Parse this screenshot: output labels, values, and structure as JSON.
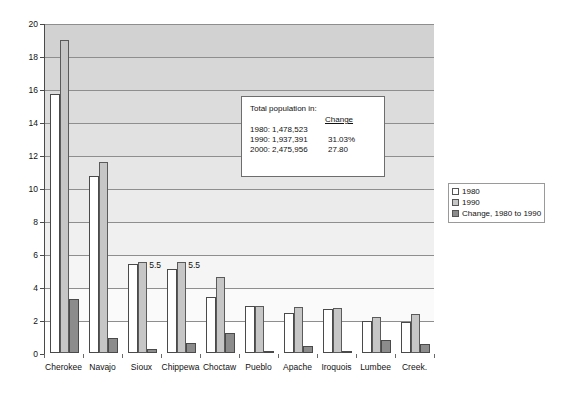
{
  "title_faint": "",
  "chart_data": {
    "type": "bar",
    "title": "",
    "subtitle": "",
    "xlabel": "",
    "ylabel": "",
    "ylim": [
      0,
      20
    ],
    "ytick_step": 2,
    "yticks": [
      "0",
      "2",
      "4",
      "6",
      "8",
      "10",
      "12",
      "14",
      "16",
      "18",
      "20"
    ],
    "grid": true,
    "legend_position": "right",
    "categories": [
      "Cherokee",
      "Navajo",
      "Sioux",
      "Chippewa",
      "Choctaw",
      "Pueblo",
      "Apache",
      "Iroquois",
      "Lumbee",
      "Creek."
    ],
    "series": [
      {
        "name": "1980",
        "color": "#ffffff",
        "values": [
          15.7,
          10.7,
          5.4,
          5.1,
          3.4,
          2.85,
          2.4,
          2.65,
          1.95,
          1.9
        ]
      },
      {
        "name": "1990",
        "color": "#c6c6c6",
        "values": [
          19.0,
          11.6,
          5.5,
          5.5,
          4.6,
          2.85,
          2.8,
          2.75,
          2.2,
          2.35
        ]
      },
      {
        "name": "Change, 1980 to 1990",
        "color": "#8c8c8c",
        "values": [
          3.3,
          0.9,
          0.25,
          0.6,
          1.2,
          0.0,
          0.45,
          0.15,
          0.8,
          0.55
        ]
      }
    ],
    "annotations": [
      {
        "text": "5.5",
        "category": "Sioux",
        "series": "1990",
        "value": 5.5
      },
      {
        "text": "5.5",
        "category": "Chippewa",
        "series": "1990",
        "value": 5.5
      }
    ]
  },
  "legend": {
    "items": [
      {
        "label": "1980",
        "swatch": "s1980"
      },
      {
        "label": "1990",
        "swatch": "s1990"
      },
      {
        "label": "Change, 1980 to 1990",
        "swatch": "schange"
      }
    ]
  },
  "infobox": {
    "heading": "Total population in:",
    "change_header": "Change",
    "rows": [
      {
        "year": "1980:",
        "population": "1,478,523",
        "change": ""
      },
      {
        "year": "1990:",
        "population": "1,937,391",
        "change": "31.03%"
      },
      {
        "year": "2000:",
        "population": "2,475,956",
        "change": "27.80"
      }
    ]
  }
}
